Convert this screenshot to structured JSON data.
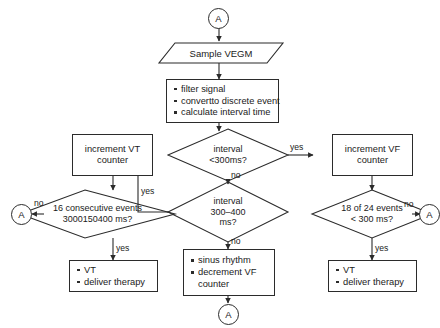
{
  "diagram": {
    "background": "#ffffff",
    "stroke": "#2b2b2b",
    "nodes": {
      "connector_top": {
        "label": "A",
        "shape": "connector"
      },
      "sample_vegm": {
        "label": "Sample VEGM",
        "shape": "io"
      },
      "signal_processing": {
        "shape": "process-bullets",
        "items": [
          "filter signal",
          "convertto discrete event",
          "calculate interval time"
        ]
      },
      "decision_interval_300": {
        "shape": "decision",
        "line1": "interval",
        "line2": "<300ms?"
      },
      "decision_interval_300_400": {
        "shape": "decision",
        "line1": "interval",
        "line2": "300–400",
        "line3": "ms?"
      },
      "increment_vt_counter": {
        "shape": "process",
        "line1": "increment VT",
        "line2": "counter"
      },
      "increment_vf_counter": {
        "shape": "process",
        "line1": "increment VF",
        "line2": "counter"
      },
      "decision_16_consecutive": {
        "shape": "decision",
        "line1": "16 consecutive events",
        "line2": "3000150400 ms?"
      },
      "decision_18_of_24": {
        "shape": "decision",
        "line1": "18 of 24 events",
        "line2": "< 300 ms?"
      },
      "vt_therapy_left": {
        "shape": "process-bullets",
        "items": [
          "VT",
          "deliver therapy"
        ]
      },
      "vt_therapy_right": {
        "shape": "process-bullets",
        "items": [
          "VT",
          "deliver therapy"
        ]
      },
      "sinus_rhythm": {
        "shape": "process-bullets",
        "items": [
          "sinus rhythm",
          "decrement VF",
          "counter"
        ]
      },
      "connector_left": {
        "label": "A",
        "shape": "connector"
      },
      "connector_right": {
        "label": "A",
        "shape": "connector"
      },
      "connector_bottom": {
        "label": "A",
        "shape": "connector"
      }
    },
    "edge_labels": {
      "yes_to_vf": "yes",
      "no_below_300": "no",
      "yes_to_vt": "yes",
      "no_below_300_400": "no",
      "no_left": "no",
      "yes_left": "yes",
      "no_right": "no",
      "yes_right": "yes"
    }
  }
}
